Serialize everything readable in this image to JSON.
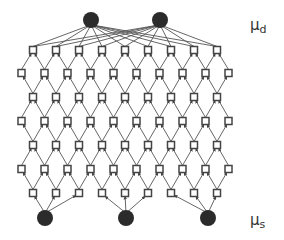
{
  "diagram": {
    "labels": {
      "top": {
        "symbol": "μ",
        "subscript": "d",
        "x": 250,
        "y": 18
      },
      "bottom": {
        "symbol": "μ",
        "subscript": "s",
        "x": 250,
        "y": 213
      }
    },
    "colors": {
      "circle": "#2b2b2b",
      "box_stroke": "#444444",
      "edge": "#555555"
    },
    "top_circles": [
      {
        "x": 91,
        "y": 20,
        "r": 8
      },
      {
        "x": 160,
        "y": 20,
        "r": 8
      }
    ],
    "bottom_circles": [
      {
        "x": 45,
        "y": 218,
        "r": 8,
        "targets": [
          0,
          1,
          2
        ]
      },
      {
        "x": 126,
        "y": 218,
        "r": 8,
        "targets": [
          3,
          4,
          5
        ]
      },
      {
        "x": 208,
        "y": 218,
        "r": 8,
        "targets": [
          6,
          7,
          8
        ]
      }
    ],
    "grid": {
      "rows_y": [
        50,
        73,
        97,
        121,
        145,
        169,
        193
      ],
      "odd_row": {
        "count": 9,
        "x_start": 33,
        "dx": 23
      },
      "even_row": {
        "count": 10,
        "x_start": 21.5,
        "dx": 23
      },
      "box_size": 7,
      "edge_direction": "upward"
    }
  }
}
